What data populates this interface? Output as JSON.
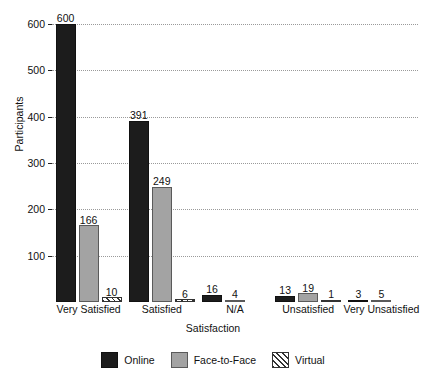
{
  "chart_data": {
    "type": "bar",
    "title": "",
    "xlabel": "Satisfaction",
    "ylabel": "Participants",
    "categories": [
      "Very Satisfied",
      "Satisfied",
      "N/A",
      "Unsatisfied",
      "Very Unsatisfied"
    ],
    "series": [
      {
        "name": "Online",
        "color": "#1c1c1c",
        "values": [
          600,
          391,
          16,
          13,
          3
        ]
      },
      {
        "name": "Face-to-Face",
        "color": "#a3a3a3",
        "values": [
          166,
          249,
          4,
          19,
          5
        ]
      },
      {
        "name": "Virtual",
        "color": "#ffffff",
        "pattern": "diagonal-hatch",
        "values": [
          10,
          6,
          0,
          1,
          0
        ]
      }
    ],
    "ylim": [
      0,
      630
    ],
    "yticks": [
      100,
      200,
      300,
      400,
      500,
      600
    ],
    "ytick_labels": [
      "100",
      "200",
      "300",
      "400",
      "500",
      "600"
    ],
    "grid": true,
    "grid_style": "dotted",
    "legend_position": "bottom-center",
    "value_labels": true
  },
  "legend": {
    "items": [
      {
        "label": "Online"
      },
      {
        "label": "Face-to-Face"
      },
      {
        "label": "Virtual"
      }
    ]
  }
}
